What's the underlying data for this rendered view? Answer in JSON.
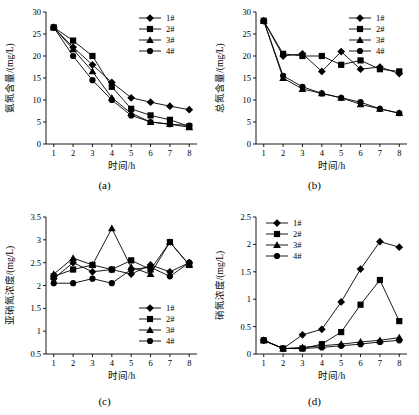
{
  "figure": {
    "panels": [
      {
        "id": "a",
        "caption": "(a)",
        "chart_data": {
          "type": "line",
          "title": "",
          "xlabel": "时间/h",
          "ylabel": "氨氮含量/(mg/L)",
          "x": [
            1,
            2,
            3,
            4,
            5,
            6,
            7,
            8
          ],
          "xlim": [
            0.6,
            8.4
          ],
          "ylim": [
            0,
            30
          ],
          "xticks": [
            1,
            2,
            3,
            4,
            5,
            6,
            7,
            8
          ],
          "yticks": [
            0,
            5,
            10,
            15,
            20,
            25,
            30
          ],
          "grid": false,
          "legend_position": "top-right",
          "series": [
            {
              "name": "1#",
              "marker": "diamond",
              "values": [
                26.5,
                22.0,
                18.0,
                14.0,
                10.5,
                9.5,
                8.6,
                7.8
              ]
            },
            {
              "name": "2#",
              "marker": "square",
              "values": [
                26.5,
                23.5,
                20.0,
                13.0,
                8.0,
                6.5,
                5.5,
                4.0
              ]
            },
            {
              "name": "3#",
              "marker": "triangle",
              "values": [
                26.5,
                21.5,
                16.5,
                10.5,
                7.0,
                5.0,
                4.5,
                3.8
              ]
            },
            {
              "name": "4#",
              "marker": "circle",
              "values": [
                26.5,
                20.0,
                14.5,
                10.0,
                6.5,
                5.0,
                4.5,
                4.2
              ]
            }
          ]
        }
      },
      {
        "id": "b",
        "caption": "(b)",
        "chart_data": {
          "type": "line",
          "title": "",
          "xlabel": "时间/h",
          "ylabel": "总氮含量/(mg/L)",
          "x": [
            1,
            2,
            3,
            4,
            5,
            6,
            7,
            8
          ],
          "xlim": [
            0.6,
            8.4
          ],
          "ylim": [
            0,
            30
          ],
          "xticks": [
            1,
            2,
            3,
            4,
            5,
            6,
            7,
            8
          ],
          "yticks": [
            0,
            5,
            10,
            15,
            20,
            25,
            30
          ],
          "grid": false,
          "legend_position": "top-right",
          "series": [
            {
              "name": "1#",
              "marker": "diamond",
              "values": [
                28.0,
                20.0,
                20.5,
                16.5,
                21.0,
                17.0,
                17.5,
                16.0
              ]
            },
            {
              "name": "2#",
              "marker": "square",
              "values": [
                28.0,
                20.5,
                20.0,
                20.0,
                18.0,
                19.0,
                17.0,
                16.5
              ]
            },
            {
              "name": "3#",
              "marker": "triangle",
              "values": [
                28.0,
                15.0,
                12.5,
                11.5,
                10.5,
                9.0,
                8.0,
                7.0
              ]
            },
            {
              "name": "4#",
              "marker": "circle",
              "values": [
                28.0,
                15.5,
                13.0,
                11.5,
                10.5,
                9.5,
                8.0,
                7.0
              ]
            }
          ]
        }
      },
      {
        "id": "c",
        "caption": "(c)",
        "chart_data": {
          "type": "line",
          "title": "",
          "xlabel": "时间/h",
          "ylabel": "亚硝氮浓度/(mg/L)",
          "x": [
            1,
            2,
            3,
            4,
            5,
            6,
            7,
            8
          ],
          "xlim": [
            0.6,
            8.4
          ],
          "ylim": [
            0.5,
            3.5
          ],
          "xticks": [
            1,
            2,
            3,
            4,
            5,
            6,
            7,
            8
          ],
          "yticks": [
            0.5,
            1.0,
            1.5,
            2.0,
            2.5,
            3.0,
            3.5
          ],
          "grid": false,
          "legend_position": "bottom-right",
          "series": [
            {
              "name": "1#",
              "marker": "diamond",
              "values": [
                2.15,
                2.5,
                2.3,
                2.35,
                2.25,
                2.45,
                2.3,
                2.5
              ]
            },
            {
              "name": "2#",
              "marker": "square",
              "values": [
                2.2,
                2.35,
                2.45,
                2.35,
                2.55,
                2.35,
                2.95,
                2.45
              ]
            },
            {
              "name": "3#",
              "marker": "triangle",
              "values": [
                2.25,
                2.6,
                2.45,
                3.25,
                2.4,
                2.25,
                2.95,
                2.45
              ]
            },
            {
              "name": "4#",
              "marker": "circle",
              "values": [
                2.05,
                2.05,
                2.15,
                2.05,
                2.35,
                2.4,
                2.2,
                2.5
              ]
            }
          ]
        }
      },
      {
        "id": "d",
        "caption": "(d)",
        "chart_data": {
          "type": "line",
          "title": "",
          "xlabel": "时间/h",
          "ylabel": "硝氮浓度/(mg/L)",
          "x": [
            1,
            2,
            3,
            4,
            5,
            6,
            7,
            8
          ],
          "xlim": [
            0.6,
            8.4
          ],
          "ylim": [
            0,
            2.5
          ],
          "xticks": [
            1,
            2,
            3,
            4,
            5,
            6,
            7,
            8
          ],
          "yticks": [
            0,
            0.5,
            1.0,
            1.5,
            2.0,
            2.5
          ],
          "grid": false,
          "legend_position": "top-left",
          "series": [
            {
              "name": "1#",
              "marker": "diamond",
              "values": [
                0.25,
                0.1,
                0.35,
                0.45,
                0.95,
                1.55,
                2.05,
                1.95
              ]
            },
            {
              "name": "2#",
              "marker": "square",
              "values": [
                0.25,
                0.1,
                0.1,
                0.18,
                0.4,
                0.9,
                1.35,
                0.6
              ]
            },
            {
              "name": "3#",
              "marker": "triangle",
              "values": [
                0.25,
                0.1,
                0.12,
                0.15,
                0.18,
                0.22,
                0.25,
                0.3
              ]
            },
            {
              "name": "4#",
              "marker": "circle",
              "values": [
                0.25,
                0.1,
                0.1,
                0.12,
                0.15,
                0.18,
                0.22,
                0.25
              ]
            }
          ]
        }
      }
    ]
  }
}
